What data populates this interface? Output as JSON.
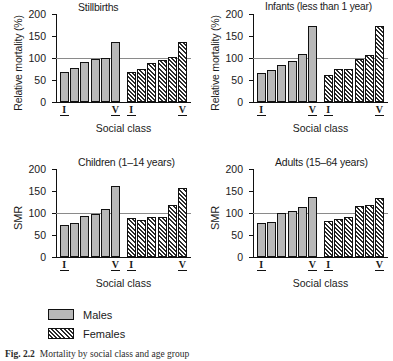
{
  "figure": {
    "caption_label": "Fig. 2.2",
    "caption_text": "Mortality by social class and age group"
  },
  "legend": {
    "items": [
      {
        "key": "males",
        "label": "Males",
        "swatch": "solid-grey-swatch"
      },
      {
        "key": "females",
        "label": "Females",
        "swatch": "hatched-swatch"
      }
    ]
  },
  "axis": {
    "xlabel": "Social class",
    "ylabel_relative": "Relative mortality (%)",
    "ylabel_smr": "SMR",
    "yticks": [
      "0",
      "50",
      "100",
      "150",
      "200"
    ],
    "xticks": [
      "I",
      "V",
      "I",
      "V"
    ],
    "reference_line_value": 100
  },
  "chart_data": [
    {
      "id": "stillbirths",
      "type": "bar",
      "title": "Stillbirths",
      "xlabel": "Social class",
      "ylabel": "Relative mortality (%)",
      "ylim": [
        0,
        200
      ],
      "yticks": [
        0,
        50,
        100,
        150,
        200
      ],
      "grid": false,
      "reference_line": 100,
      "legend_position": "below-figure",
      "categories": [
        "I",
        "II",
        "IIIN",
        "IIIM",
        "IV",
        "V"
      ],
      "series": [
        {
          "name": "Males",
          "values": [
            68,
            77,
            90,
            97,
            100,
            137
          ]
        },
        {
          "name": "Females",
          "values": [
            68,
            76,
            89,
            96,
            102,
            137
          ]
        }
      ]
    },
    {
      "id": "infants",
      "type": "bar",
      "title": "Infants (less than 1 year)",
      "xlabel": "Social class",
      "ylabel": "Relative mortality (%)",
      "ylim": [
        0,
        200
      ],
      "yticks": [
        0,
        50,
        100,
        150,
        200
      ],
      "grid": false,
      "reference_line": 100,
      "legend_position": "below-figure",
      "categories": [
        "I",
        "II",
        "IIIN",
        "IIIM",
        "IV",
        "V"
      ],
      "series": [
        {
          "name": "Males",
          "values": [
            66,
            73,
            83,
            93,
            110,
            172
          ]
        },
        {
          "name": "Females",
          "values": [
            61,
            76,
            76,
            97,
            107,
            173
          ]
        }
      ]
    },
    {
      "id": "children",
      "type": "bar",
      "title": "Children (1–14 years)",
      "xlabel": "Social class",
      "ylabel": "SMR",
      "ylim": [
        0,
        200
      ],
      "yticks": [
        0,
        50,
        100,
        150,
        200
      ],
      "grid": false,
      "reference_line": 100,
      "legend_position": "below-figure",
      "categories": [
        "I",
        "II",
        "IIIN",
        "IIIM",
        "IV",
        "V"
      ],
      "series": [
        {
          "name": "Males",
          "values": [
            72,
            78,
            93,
            98,
            110,
            161
          ]
        },
        {
          "name": "Females",
          "values": [
            88,
            83,
            92,
            92,
            119,
            156
          ]
        }
      ]
    },
    {
      "id": "adults",
      "type": "bar",
      "title": "Adults (15–64 years)",
      "xlabel": "Social class",
      "ylabel": "SMR",
      "ylim": [
        0,
        200
      ],
      "yticks": [
        0,
        50,
        100,
        150,
        200
      ],
      "grid": false,
      "reference_line": 100,
      "legend_position": "below-figure",
      "categories": [
        "I",
        "II",
        "IIIN",
        "IIIM",
        "IV",
        "V"
      ],
      "series": [
        {
          "name": "Males",
          "values": [
            77,
            80,
            99,
            105,
            113,
            136
          ]
        },
        {
          "name": "Females",
          "values": [
            81,
            87,
            92,
            115,
            119,
            133
          ]
        }
      ]
    }
  ],
  "colors": {
    "male_fill": "#b8b8b8",
    "female_fill": "#ffffff",
    "hatch": "#2b2b2b",
    "axis": "#111111",
    "reference_line": "#8a8a8a"
  }
}
